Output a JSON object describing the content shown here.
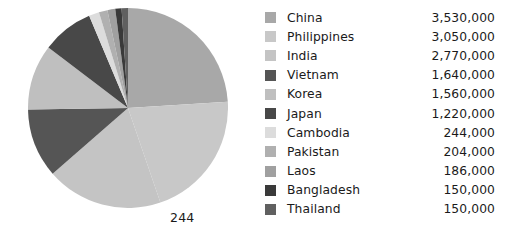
{
  "chart_data": {
    "type": "pie",
    "title": "",
    "xlabel": "",
    "ylabel": "",
    "legend_position": "right",
    "grid": false,
    "start_angle_deg": 90,
    "direction": "clockwise",
    "total": 14704000,
    "categories": [
      "China",
      "Philippines",
      "India",
      "Vietnam",
      "Korea",
      "Japan",
      "Cambodia",
      "Pakistan",
      "Laos",
      "Bangladesh",
      "Thailand"
    ],
    "values": [
      3530000,
      3050000,
      2770000,
      1640000,
      1560000,
      1220000,
      244000,
      204000,
      186000,
      150000,
      150000
    ],
    "value_labels": [
      "3,530,000",
      "3,050,000",
      "2,770,000",
      "1,640,000",
      "1,560,000",
      "1,220,000",
      "244,000",
      "204,000",
      "186,000",
      "150,000",
      "150,000"
    ],
    "colors": [
      "#a8a8a8",
      "#c8c8c8",
      "#c4c4c4",
      "#555555",
      "#bfbfbf",
      "#484848",
      "#dcdcdc",
      "#b0b0b0",
      "#a0a0a0",
      "#3a3a3a",
      "#606060"
    ],
    "annotations": [
      {
        "text": "244",
        "position": "below-right-of-pie"
      }
    ]
  },
  "annotation": {
    "text": "244"
  },
  "legend": {
    "items": [
      {
        "label": "China",
        "value": "3,530,000",
        "color": "#a8a8a8"
      },
      {
        "label": "Philippines",
        "value": "3,050,000",
        "color": "#c8c8c8"
      },
      {
        "label": "India",
        "value": "2,770,000",
        "color": "#c4c4c4"
      },
      {
        "label": "Vietnam",
        "value": "1,640,000",
        "color": "#555555"
      },
      {
        "label": "Korea",
        "value": "1,560,000",
        "color": "#bfbfbf"
      },
      {
        "label": "Japan",
        "value": "1,220,000",
        "color": "#484848"
      },
      {
        "label": "Cambodia",
        "value": "244,000",
        "color": "#dcdcdc"
      },
      {
        "label": "Pakistan",
        "value": "204,000",
        "color": "#b0b0b0"
      },
      {
        "label": "Laos",
        "value": "186,000",
        "color": "#a0a0a0"
      },
      {
        "label": "Bangladesh",
        "value": "150,000",
        "color": "#3a3a3a"
      },
      {
        "label": "Thailand",
        "value": "150,000",
        "color": "#606060"
      }
    ]
  }
}
